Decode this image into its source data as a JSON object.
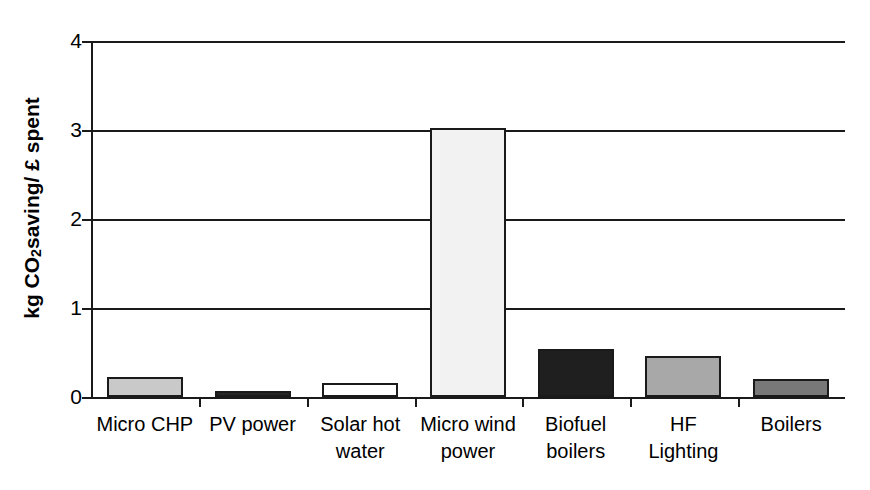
{
  "chart_data": {
    "type": "bar",
    "title": "",
    "subtitle": "",
    "xlabel": "",
    "ylabel": "kg CO2 saving/ £ spent",
    "ylabel_parts": {
      "prefix": "kg CO",
      "subscript": "2",
      "suffix": " saving/ £ spent"
    },
    "categories": [
      "Micro CHP",
      "PV power",
      "Solar hot water",
      "Micro wind power",
      "Biofuel boilers",
      "HF Lighting",
      "Boilers"
    ],
    "category_lines": [
      [
        "Micro CHP"
      ],
      [
        "PV power"
      ],
      [
        "Solar hot",
        "water"
      ],
      [
        "Micro wind",
        "power"
      ],
      [
        "Biofuel",
        "boilers"
      ],
      [
        "HF",
        "Lighting"
      ],
      [
        "Boilers"
      ]
    ],
    "values": [
      0.23,
      0.07,
      0.16,
      3.02,
      0.54,
      0.46,
      0.2
    ],
    "bar_colors": [
      "#c9c9c9",
      "#262626",
      "#ffffff",
      "#f2f2f2",
      "#1f1f1f",
      "#a8a8a8",
      "#787878"
    ],
    "bar_edge_color": "#1a1a1a",
    "ylim": [
      0,
      4
    ],
    "ytick_labels": [
      "0",
      "1",
      "2",
      "3",
      "4"
    ],
    "ytick_values": [
      0,
      1,
      2,
      3,
      4
    ],
    "grid": true,
    "grid_axis": "y",
    "legend": false,
    "legend_position": "none",
    "axis_color": "#1a1a1a",
    "background_color": "#ffffff"
  }
}
